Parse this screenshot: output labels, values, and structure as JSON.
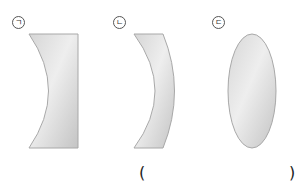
{
  "figure": {
    "type": "lens-diagram",
    "items": [
      {
        "marker": "ㄱ",
        "shape": "plano-concave lens"
      },
      {
        "marker": "ㄴ",
        "shape": "concave-convex meniscus lens"
      },
      {
        "marker": "ㄷ",
        "shape": "biconvex lens"
      }
    ],
    "answer_blank": {
      "open": "(",
      "close": ")"
    }
  },
  "colors": {
    "lens_fill_light": "#eeeeee",
    "lens_fill_dark": "#c9c9c9",
    "lens_stroke": "#a8a8a8"
  }
}
